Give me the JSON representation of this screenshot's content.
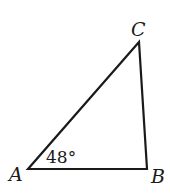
{
  "diagram": {
    "type": "triangle",
    "stroke_color": "#1a1a1a",
    "background": "#ffffff",
    "vertices": {
      "A": {
        "label": "A",
        "x": 28,
        "y": 169
      },
      "B": {
        "label": "B",
        "x": 147,
        "y": 169
      },
      "C": {
        "label": "C",
        "x": 139,
        "y": 42
      }
    },
    "angle_annotation": {
      "vertex": "A",
      "text": "48°"
    }
  }
}
